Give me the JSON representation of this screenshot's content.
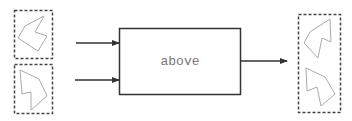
{
  "diagram": {
    "operation": {
      "label": "above"
    },
    "inputs": [
      {
        "name": "input-top",
        "shape": "polygon-arrow-shape"
      },
      {
        "name": "input-bottom",
        "shape": "polygon-arrow-shape"
      }
    ],
    "output": {
      "name": "stacked-result",
      "shapes": [
        "polygon-arrow-shape",
        "polygon-arrow-shape"
      ]
    },
    "colors": {
      "box_stroke": "#333333",
      "arrow": "#333333",
      "dashed_border": "#444444",
      "shape_stroke": "#aaaaaa",
      "label": "#777777"
    }
  }
}
